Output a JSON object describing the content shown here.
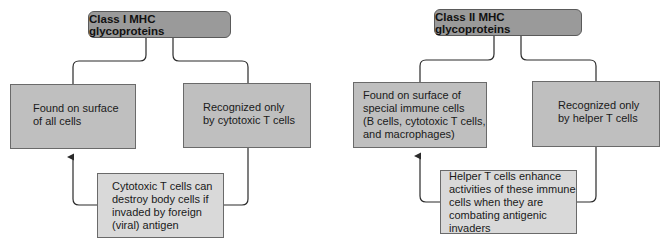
{
  "class1": {
    "title": "Class I MHC glycoproteins",
    "left_box": "Found on surface\nof all cells",
    "right_box": "Recognized only\nby cytotoxic T cells",
    "bottom_box": "Cytotoxic T cells can\ndestroy body cells if\ninvaded by foreign\n(viral) antigen"
  },
  "class2": {
    "title": "Class II MHC glycoproteins",
    "left_box": "Found on surface of\nspecial immune cells\n(B cells, cytotoxic T cells,\nand macrophages)",
    "right_box": "Recognized only\nby helper T cells",
    "bottom_box": "Helper T cells enhance\nactivities of these immune\ncells when they are\ncombating antigenic\ninvaders"
  },
  "colors": {
    "title_fill": "#9a9a9a",
    "box_fill": "#bfbfbf",
    "bottom_box_fill": "#d9d9d9",
    "line": "#2a2a2a"
  }
}
